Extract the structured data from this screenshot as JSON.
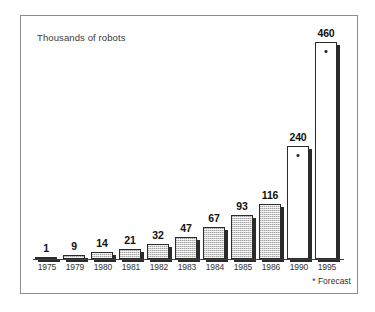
{
  "figure": {
    "title": "Thousands of robots",
    "footnote": "* Forecast",
    "frame_color": "#8c8c8c",
    "bar_fill_color": "#cfcfcf",
    "bar_line_color": "#2b2b2b",
    "bar_shadow_color": "#2b2b2b",
    "forecast_marker": "•"
  },
  "chart_data": {
    "type": "bar",
    "title": "Thousands of robots",
    "xlabel": "",
    "ylabel": "Thousands of robots",
    "ylim": [
      0,
      460
    ],
    "grid": false,
    "legend": null,
    "annotations": [
      "* Forecast"
    ],
    "categories": [
      "1975",
      "1979",
      "1980",
      "1981",
      "1982",
      "1983",
      "1984",
      "1985",
      "1986",
      "1990",
      "1995"
    ],
    "values": [
      1,
      9,
      14,
      21,
      32,
      47,
      67,
      93,
      116,
      240,
      460
    ],
    "bars": [
      {
        "category": "1975",
        "value": 1,
        "label": "1",
        "forecast": false,
        "style": "filled"
      },
      {
        "category": "1979",
        "value": 9,
        "label": "9",
        "forecast": false,
        "style": "filled"
      },
      {
        "category": "1980",
        "value": 14,
        "label": "14",
        "forecast": false,
        "style": "filled"
      },
      {
        "category": "1981",
        "value": 21,
        "label": "21",
        "forecast": false,
        "style": "filled"
      },
      {
        "category": "1982",
        "value": 32,
        "label": "32",
        "forecast": false,
        "style": "filled"
      },
      {
        "category": "1983",
        "value": 47,
        "label": "47",
        "forecast": false,
        "style": "filled"
      },
      {
        "category": "1984",
        "value": 67,
        "label": "67",
        "forecast": false,
        "style": "filled"
      },
      {
        "category": "1985",
        "value": 93,
        "label": "93",
        "forecast": false,
        "style": "filled"
      },
      {
        "category": "1986",
        "value": 116,
        "label": "116",
        "forecast": false,
        "style": "filled"
      },
      {
        "category": "1990",
        "value": 240,
        "label": "240",
        "forecast": true,
        "style": "open"
      },
      {
        "category": "1995",
        "value": 460,
        "label": "460",
        "forecast": true,
        "style": "open"
      }
    ]
  }
}
